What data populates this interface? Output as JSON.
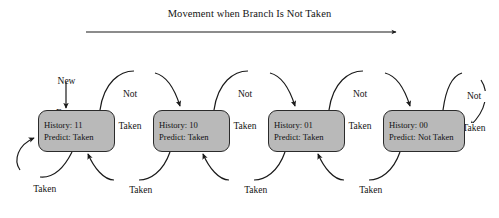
{
  "diagram": {
    "title": "Movement when Branch Is Not Taken",
    "type": "state-machine",
    "colors": {
      "state_fill": "#b9b9b9",
      "state_border": "#2b2b2b",
      "line": "#1a1a1a",
      "text": "#141414",
      "background": "#ffffff"
    },
    "entry": {
      "label_line1": "New",
      "label_line2": "Entry",
      "target_state": 0
    },
    "states": [
      {
        "id": "s11",
        "history_label": "History: 11",
        "predict_label": "Predict: Taken"
      },
      {
        "id": "s10",
        "history_label": "History: 10",
        "predict_label": "Predict: Taken"
      },
      {
        "id": "s01",
        "history_label": "History: 01",
        "predict_label": "Predict: Taken"
      },
      {
        "id": "s00",
        "history_label": "History: 00",
        "predict_label": "Predict: Not Taken"
      }
    ],
    "transitions_not_taken": [
      {
        "from": "s11",
        "to": "s10",
        "line1": "Not",
        "line2": "Taken"
      },
      {
        "from": "s10",
        "to": "s01",
        "line1": "Not",
        "line2": "Taken"
      },
      {
        "from": "s01",
        "to": "s00",
        "line1": "Not",
        "line2": "Taken"
      },
      {
        "from": "s00",
        "to": "s00",
        "line1": "Not",
        "line2": "Taken"
      }
    ],
    "transitions_taken": [
      {
        "from": "s11",
        "to": "s11",
        "label": "Taken"
      },
      {
        "from": "s10",
        "to": "s11",
        "label": "Taken"
      },
      {
        "from": "s01",
        "to": "s10",
        "label": "Taken"
      },
      {
        "from": "s00",
        "to": "s01",
        "label": "Taken"
      }
    ]
  }
}
